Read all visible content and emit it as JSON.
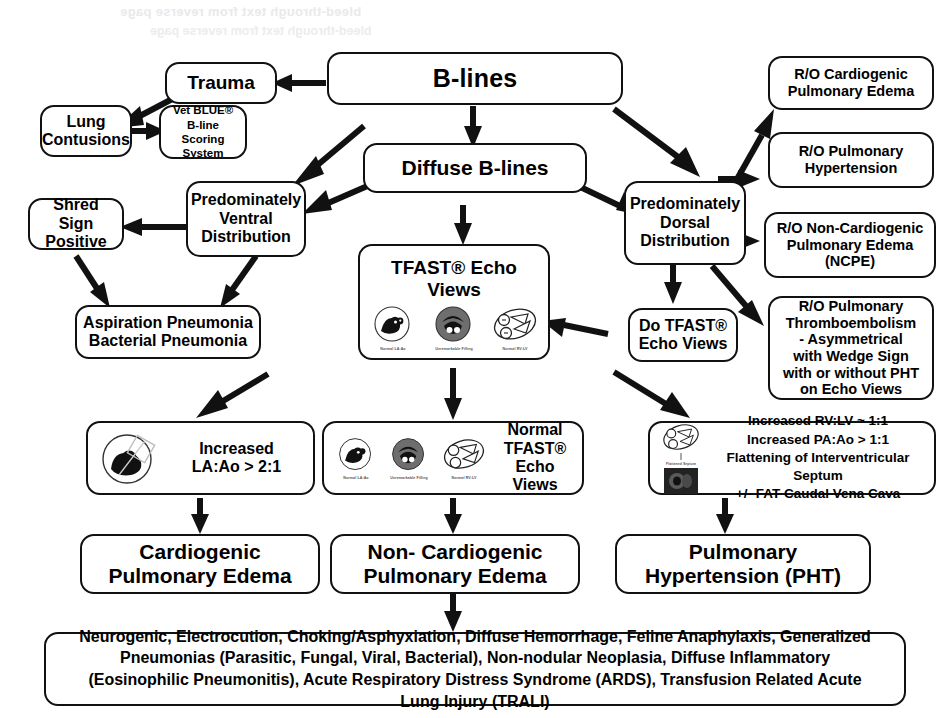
{
  "ghost_text": {
    "line1": "bleed-through text from reverse page",
    "line2": "bleed-through text from reverse page"
  },
  "diagram": {
    "nodes": {
      "b_lines": "B-lines",
      "trauma": "Trauma",
      "lung_contusions": "Lung\nContusions",
      "vet_blue": "Vet BLUE®\nB-line Scoring\nSystem",
      "diffuse_b_lines": "Diffuse B-lines",
      "ventral": "Predominately\nVentral\nDistribution",
      "dorsal": "Predominately\nDorsal\nDistribution",
      "shred_sign": "Shred Sign\nPositive",
      "aspiration": "Aspiration Pneumonia\nBacterial Pneumonia",
      "tfast_echo_views": "TFAST® Echo\nViews",
      "do_tfast": "Do TFAST®\nEcho Views",
      "ro_cardiogenic": "R/O Cardiogenic\nPulmonary Edema",
      "ro_pht": "R/O Pulmonary\nHypertension",
      "ro_ncpe": "R/O Non-Cardiogenic\nPulmonary Edema\n(NCPE)",
      "ro_pte": "R/O Pulmonary\nThromboembolism\n- Asymmetrical\nwith Wedge Sign\nwith or without PHT\non Echo Views",
      "increased_laao": "Increased\nLA:Ao > 2:1",
      "normal_tfast": "Normal TFAST®\nEcho Views",
      "pht_findings": "Increased RV:LV ~ 1:1\nIncreased PA:Ao > 1:1\nFlattening of Interventricular Septum\n+/- FAT Caudal Vena Cava",
      "cardiogenic_pe": "Cardiogenic\nPulmonary Edema",
      "noncardiogenic_pe": "Non- Cardiogenic\nPulmonary Edema",
      "pulmonary_hypertension": "Pulmonary\nHypertension (PHT)",
      "differentials": "Neurogenic, Electrocution, Choking/Asphyxiation, Diffuse Hemorrhage, Feline Anaphylaxis, Generalized Pneumonias (Parasitic, Fungal, Viral, Bacterial), Non-nodular Neoplasia, Diffuse Inflammatory (Eosinophilic Pneumonitis), Acute Respiratory Distress Syndrome (ARDS), Transfusion Related Acute Lung Injury (TRALI)"
    },
    "thumb_captions": {
      "la_ao": "Normal LA:Ao",
      "filling": "Unremarkable Filling",
      "rv_lv": "Normal RV:LV",
      "pht_septum": "Flattened Septum"
    },
    "colors": {
      "stroke": "#111111",
      "background": "#ffffff",
      "text": "#000000"
    }
  }
}
